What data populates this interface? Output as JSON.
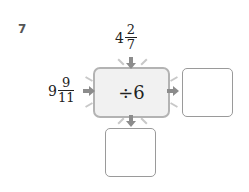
{
  "problem_number": "7",
  "top_input": {
    "whole": "4",
    "numerator": "2",
    "denominator": "7"
  },
  "left_input": {
    "whole": "9",
    "numerator": "9",
    "denominator": "11"
  },
  "operation": "÷6",
  "answer_boxes": [
    {
      "position": "right",
      "value": ""
    },
    {
      "position": "bottom",
      "value": ""
    }
  ],
  "colors": {
    "arrow": "#8c8c8c",
    "box_border": "#b3b3b3",
    "box_fill": "#f1f1f1"
  }
}
